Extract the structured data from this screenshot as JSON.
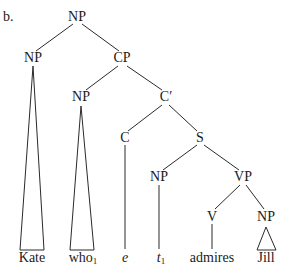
{
  "example_label": "b.",
  "nodes": {
    "root_np": "NP",
    "np_kate": "NP",
    "cp": "CP",
    "np_who": "NP",
    "c_bar": "C′",
    "c": "C",
    "s": "S",
    "np_trace": "NP",
    "vp": "VP",
    "v": "V",
    "np_jill": "NP"
  },
  "terminals": {
    "kate": "Kate",
    "who": "who",
    "who_index": "1",
    "e": "e",
    "t": "t",
    "t_index": "1",
    "admires": "admires",
    "jill": "Jill"
  },
  "line_color": "#2a2a2a"
}
